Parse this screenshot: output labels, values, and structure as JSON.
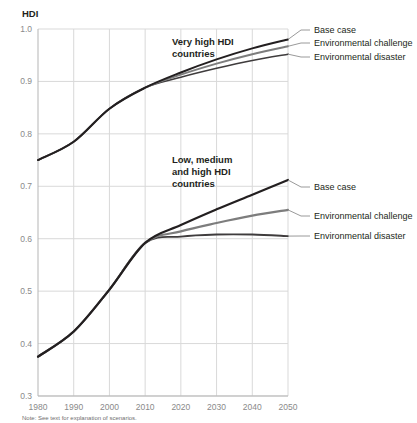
{
  "chart_data": {
    "type": "line",
    "title": "",
    "xlabel": "",
    "ylabel": "HDI",
    "xlim": [
      1980,
      2050
    ],
    "ylim": [
      0.3,
      1.0
    ],
    "grid": true,
    "legend_position": "right-inline",
    "xticks": [
      "1980",
      "1990",
      "2000",
      "2010",
      "2020",
      "2030",
      "2040",
      "2050"
    ],
    "yticks": [
      "0.3",
      "0.4",
      "0.5",
      "0.6",
      "0.7",
      "0.8",
      "0.9",
      "1.0"
    ],
    "x": [
      1980,
      1990,
      2000,
      2010,
      2020,
      2030,
      2040,
      2050
    ],
    "groups": [
      {
        "name": "Very high HDI countries",
        "label_lines": [
          "Very high HDI",
          "countries"
        ],
        "series": [
          {
            "name": "Base case",
            "color": "#231f20",
            "width": 2.0,
            "values": [
              0.75,
              0.785,
              0.848,
              0.888,
              0.917,
              0.942,
              0.963,
              0.98
            ]
          },
          {
            "name": "Environmental challenge",
            "color": "#7d7d7d",
            "width": 2.0,
            "values": [
              0.75,
              0.785,
              0.848,
              0.888,
              0.913,
              0.934,
              0.952,
              0.967
            ]
          },
          {
            "name": "Environmental disaster",
            "color": "#3f3c3d",
            "width": 1.6,
            "values": [
              0.75,
              0.785,
              0.848,
              0.888,
              0.908,
              0.925,
              0.94,
              0.952
            ]
          }
        ]
      },
      {
        "name": "Low, medium and high HDI countries",
        "label_lines": [
          "Low, medium",
          "and high HDI",
          "countries"
        ],
        "series": [
          {
            "name": "Base case",
            "color": "#231f20",
            "width": 2.2,
            "values": [
              0.375,
              0.423,
              0.503,
              0.592,
              0.626,
              0.656,
              0.684,
              0.712
            ]
          },
          {
            "name": "Environmental challenge",
            "color": "#7d7d7d",
            "width": 2.2,
            "values": [
              0.375,
              0.423,
              0.503,
              0.592,
              0.614,
              0.63,
              0.644,
              0.655
            ]
          },
          {
            "name": "Environmental disaster",
            "color": "#3f3c3d",
            "width": 1.8,
            "values": [
              0.375,
              0.423,
              0.503,
              0.592,
              0.604,
              0.608,
              0.608,
              0.605
            ]
          }
        ]
      }
    ],
    "legends": [
      {
        "group": "Very high HDI countries",
        "label": "Base case",
        "y_value": 0.98
      },
      {
        "group": "Very high HDI countries",
        "label": "Environmental challenge",
        "y_value": 0.967
      },
      {
        "group": "Very high HDI countries",
        "label": "Environmental disaster",
        "y_value": 0.952
      },
      {
        "group": "Low, medium and high HDI countries",
        "label": "Base case",
        "y_value": 0.712
      },
      {
        "group": "Low, medium and high HDI countries",
        "label": "Environmental challenge",
        "y_value": 0.655
      },
      {
        "group": "Low, medium and high HDI countries",
        "label": "Environmental disaster",
        "y_value": 0.605
      }
    ],
    "annotations": {
      "note": "Note: See text for explanation of scenarios."
    },
    "colors": {
      "base_case": "#231f20",
      "environmental_challenge": "#7d7d7d",
      "environmental_disaster": "#3f3c3d",
      "grid": "#d9d9d9",
      "tick_text": "#8a8a8a"
    }
  }
}
